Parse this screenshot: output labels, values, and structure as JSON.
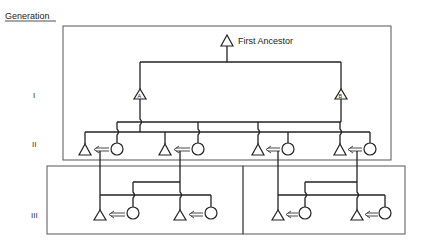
{
  "header": {
    "title": "Generation"
  },
  "generations": [
    {
      "label": "I"
    },
    {
      "label": "II"
    },
    {
      "label": "III"
    }
  ],
  "nodes": {
    "first_ancestor": {
      "label": "First Ancestor",
      "symbol": "triangle"
    },
    "gen1": [
      {
        "symbol": "triangle",
        "mark": "A"
      },
      {
        "symbol": "triangle",
        "mark": "B"
      }
    ],
    "gen2_pairs": 4,
    "gen3_pairs": 4
  },
  "legend_hint": {
    "triangle": "male",
    "circle": "female",
    "double-arrow": "marriage / moves to"
  },
  "colors": {
    "line": "#222222",
    "box": "#555555",
    "background": "#ffffff"
  }
}
